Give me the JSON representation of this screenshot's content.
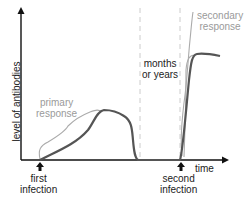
{
  "diagram": {
    "y_axis_label": "level of antibodies",
    "x_axis_label": "time",
    "primary_label_line1": "primary",
    "primary_label_line2": "response",
    "secondary_label_line1": "secondary",
    "secondary_label_line2": "response",
    "gap_label_line1": "months",
    "gap_label_line2": "or years",
    "event1_line1": "first",
    "event1_line2": "infection",
    "event2_line1": "second",
    "event2_line2": "infection",
    "colors": {
      "axis": "#111111",
      "antibody_curve": "#555555",
      "bracket": "#aaaaaa",
      "dashed_divider": "#cccccc",
      "annotation_gray": "#9a9a9a"
    }
  }
}
